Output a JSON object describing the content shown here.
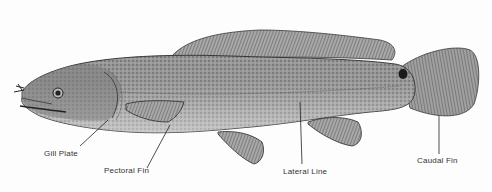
{
  "diagram": {
    "labels": [
      {
        "id": "gill-plate",
        "text": "Gill Plate"
      },
      {
        "id": "pectoral-fin",
        "text": "Pectoral Fin"
      },
      {
        "id": "lateral-line",
        "text": "Lateral Line"
      },
      {
        "id": "caudal-fin",
        "text": "Caudal Fin"
      }
    ]
  },
  "colors": {
    "body": "#8a8a8a",
    "fin": "#7a7a7a",
    "outline": "#2b2b2b",
    "leader": "#222222",
    "text": "#333333"
  }
}
